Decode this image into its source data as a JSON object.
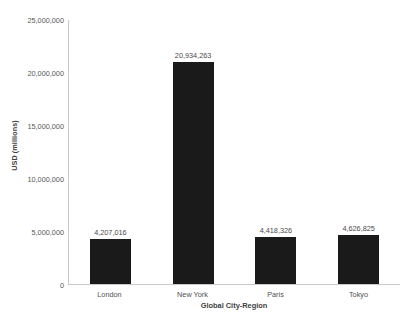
{
  "chart_data": {
    "type": "bar",
    "title": "",
    "subtitle": "",
    "xlabel": "Global City-Region",
    "ylabel": "USD (millions)",
    "categories": [
      "London",
      "New York",
      "Paris",
      "Tokyo"
    ],
    "values": [
      4207016,
      20934263,
      4418326,
      4626825
    ],
    "value_labels": [
      "4,207,016",
      "20,934,263",
      "4,418,326",
      "4,626,825"
    ],
    "ylim": [
      0,
      25000000
    ],
    "ytick_values": [
      0,
      5000000,
      10000000,
      15000000,
      20000000,
      25000000
    ],
    "ytick_labels": [
      "0",
      "5,000,000",
      "10,000,000",
      "15,000,000",
      "20,000,000",
      "25,000,000"
    ],
    "grid": false,
    "legend": false,
    "legend_position": "none",
    "bar_color": "#1a1a1a",
    "axis_color": "#c9c9c9",
    "background_color": "#ffffff",
    "text_color": "#4a4a4a"
  }
}
